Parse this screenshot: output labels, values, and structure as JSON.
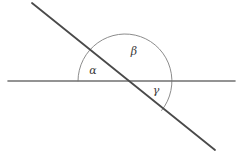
{
  "figure": {
    "width": 242,
    "height": 161,
    "background_color": "#ffffff"
  },
  "colors": {
    "horizontal_line": "#707070",
    "diagonal_line": "#4a4a4a",
    "arc": "#8c8c8c",
    "label_text": "#3a3a3a"
  },
  "chart_data": {
    "type": "diagram",
    "elements": [
      {
        "name": "horizontal-line",
        "kind": "line",
        "x1": 8,
        "y1": 81,
        "x2": 235,
        "y2": 81,
        "stroke": "#707070",
        "stroke_width": 1.6
      },
      {
        "name": "diagonal-line",
        "kind": "line",
        "x1": 32,
        "y1": 3,
        "x2": 215,
        "y2": 150,
        "stroke": "#4a4a4a",
        "stroke_width": 1.8
      },
      {
        "name": "angle-arc",
        "kind": "arc",
        "center_x": 125,
        "center_y": 81,
        "radius": 47,
        "start_angle_deg": 180,
        "end_angle_deg": -38.8,
        "sweep": "counterclockwise-through-top",
        "stroke": "#8c8c8c",
        "stroke_width": 1.0
      }
    ],
    "intersection_point": {
      "x": 125,
      "y": 81
    },
    "labels": [
      {
        "name": "alpha",
        "text": "α",
        "x": 93,
        "y": 71
      },
      {
        "name": "beta",
        "text": "β",
        "x": 134,
        "y": 52
      },
      {
        "name": "gamma",
        "text": "γ",
        "x": 156,
        "y": 91
      }
    ]
  },
  "labels": {
    "alpha": "α",
    "beta": "β",
    "gamma": "γ"
  }
}
